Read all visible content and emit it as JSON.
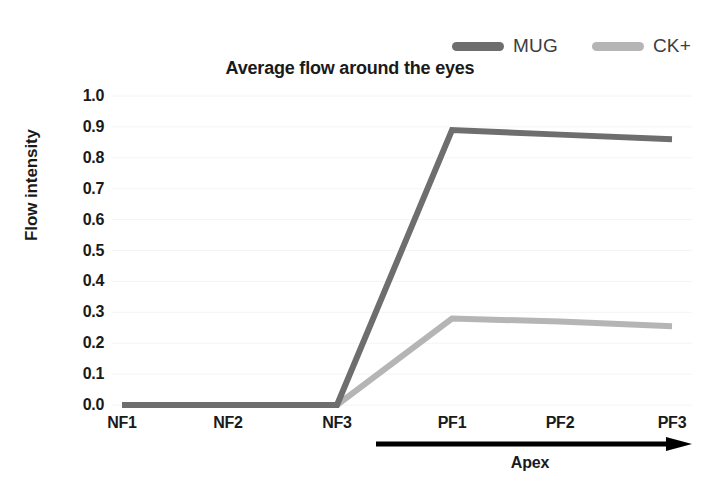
{
  "chart_data": {
    "type": "line",
    "title": "Average flow around the eyes",
    "xlabel": "",
    "ylabel": "Flow intensity",
    "categories": [
      "NF1",
      "NF2",
      "NF3",
      "PF1",
      "PF2",
      "PF3"
    ],
    "series": [
      {
        "name": "MUG",
        "color": "#6e6e6e",
        "values": [
          0.0,
          0.0,
          0.0,
          0.89,
          0.875,
          0.86
        ]
      },
      {
        "name": "CK+",
        "color": "#b5b5b5",
        "values": [
          0.0,
          0.0,
          0.0,
          0.28,
          0.27,
          0.255
        ]
      }
    ],
    "ylim": [
      0.0,
      1.0
    ],
    "ytick_labels": [
      "1.0",
      "0.9",
      "0.8",
      "0.7",
      "0.6",
      "0.5",
      "0.4",
      "0.3",
      "0.2",
      "0.1",
      "0.0"
    ],
    "ytick_values": [
      1.0,
      0.9,
      0.8,
      0.7,
      0.6,
      0.5,
      0.4,
      0.3,
      0.2,
      0.1,
      0.0
    ],
    "grid": true,
    "legend_position": "top-right",
    "annotations": [
      {
        "text": "Apex",
        "type": "arrow",
        "from_category": "PF1",
        "to_category": "PF3",
        "color": "#000000"
      }
    ]
  },
  "legend": {
    "entries": [
      {
        "label": "MUG",
        "color": "#6e6e6e"
      },
      {
        "label": "CK+",
        "color": "#b5b5b5"
      }
    ]
  },
  "axes": {
    "y_title": "Flow intensity"
  },
  "annotation": {
    "apex_label": "Apex"
  }
}
